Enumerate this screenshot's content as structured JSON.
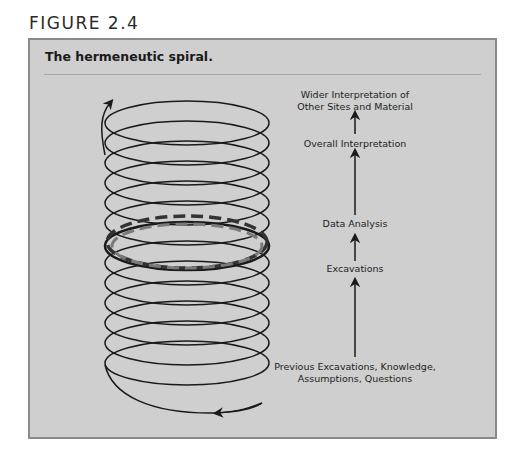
{
  "figure": {
    "label": "FIGURE 2.4",
    "title": "The hermeneutic spiral."
  },
  "diagram": {
    "type": "spiral-with-flow",
    "spiral": {
      "coils": 11,
      "direction_arrow_top": "up",
      "direction_arrow_bottom": "left",
      "highlighted_coil_dashes": [
        "dark-dashed",
        "light-dashed"
      ]
    },
    "flow": {
      "direction": "bottom-to-top",
      "steps": [
        {
          "id": "previous",
          "line1": "Previous Excavations, Knowledge,",
          "line2": "Assumptions, Questions"
        },
        {
          "id": "excavations",
          "line1": "Excavations",
          "line2": ""
        },
        {
          "id": "data-analysis",
          "line1": "Data Analysis",
          "line2": ""
        },
        {
          "id": "overall",
          "line1": "Overall Interpretation",
          "line2": ""
        },
        {
          "id": "wider",
          "line1": "Wider Interpretation of",
          "line2": "Other Sites and Material"
        }
      ]
    }
  },
  "colors": {
    "panel_bg": "#cfcfcf",
    "panel_border": "#8a8a8a",
    "stroke": "#1a1a1a",
    "dashed_dark": "#333333",
    "dashed_light": "#7a7a7a"
  }
}
